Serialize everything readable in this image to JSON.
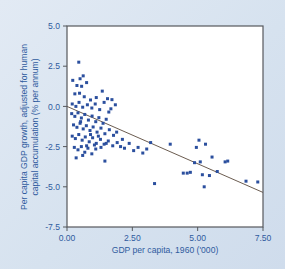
{
  "figure": {
    "background_color": "#dce6f0",
    "plot_area_color": "#ffffff",
    "frame_color": "#55585c",
    "text_color": "#2f5b9e",
    "marker_color": "#2b4f9e",
    "trendline_color": "#5a4a3c"
  },
  "chart_data": {
    "type": "scatter",
    "title": "",
    "subtitle": "",
    "xlabel": "GDP per capita, 1960 ('000)",
    "ylabel": "Per capita GDP growth, adjusted for human capital accumulation (% per annum)",
    "ylabel_line1": "Per capita GDP growth, adjusted for human",
    "ylabel_line2": "capital accumulation (% per annum)",
    "xlim": [
      0.0,
      7.5
    ],
    "ylim": [
      -7.5,
      5.0
    ],
    "xticks": [
      0.0,
      2.5,
      5.0,
      7.5
    ],
    "xtick_labels": [
      "0.00",
      "2.50",
      "5.00",
      "7.50"
    ],
    "yticks": [
      5.0,
      2.5,
      0.0,
      -2.5,
      -5.0,
      -7.5
    ],
    "ytick_labels": [
      "5.0",
      "2.5",
      "0.0",
      "-2.5",
      "-5.0",
      "-7.5"
    ],
    "grid": false,
    "legend": null,
    "legend_position": "none",
    "marker_shape": "square",
    "marker_size": 3,
    "trendline": {
      "label": "regression line",
      "x": [
        0.0,
        7.5
      ],
      "y": [
        0.0,
        -5.35
      ]
    },
    "points": [
      {
        "x": 0.45,
        "y": 2.75
      },
      {
        "x": 0.22,
        "y": 1.62
      },
      {
        "x": 0.5,
        "y": 1.72
      },
      {
        "x": 0.62,
        "y": 1.9
      },
      {
        "x": 0.38,
        "y": 1.3
      },
      {
        "x": 0.56,
        "y": 1.25
      },
      {
        "x": 0.75,
        "y": 1.48
      },
      {
        "x": 1.35,
        "y": 0.95
      },
      {
        "x": 0.3,
        "y": 0.78
      },
      {
        "x": 0.48,
        "y": 0.82
      },
      {
        "x": 0.66,
        "y": 0.6
      },
      {
        "x": 0.9,
        "y": 0.4
      },
      {
        "x": 1.12,
        "y": 0.55
      },
      {
        "x": 1.55,
        "y": 0.48
      },
      {
        "x": 1.72,
        "y": 0.42
      },
      {
        "x": 1.85,
        "y": 0.1
      },
      {
        "x": 0.2,
        "y": 0.15
      },
      {
        "x": 0.34,
        "y": 0.0
      },
      {
        "x": 0.46,
        "y": 0.25
      },
      {
        "x": 0.6,
        "y": -0.05
      },
      {
        "x": 0.78,
        "y": 0.1
      },
      {
        "x": 0.95,
        "y": -0.1
      },
      {
        "x": 1.08,
        "y": 0.15
      },
      {
        "x": 1.25,
        "y": -0.2
      },
      {
        "x": 1.42,
        "y": 0.25
      },
      {
        "x": 1.6,
        "y": -0.35
      },
      {
        "x": 0.18,
        "y": -0.45
      },
      {
        "x": 0.3,
        "y": -0.62
      },
      {
        "x": 0.42,
        "y": -0.4
      },
      {
        "x": 0.55,
        "y": -0.72
      },
      {
        "x": 0.68,
        "y": -0.5
      },
      {
        "x": 0.82,
        "y": -0.85
      },
      {
        "x": 0.96,
        "y": -0.6
      },
      {
        "x": 1.1,
        "y": -0.95
      },
      {
        "x": 1.22,
        "y": -0.7
      },
      {
        "x": 1.38,
        "y": -1.05
      },
      {
        "x": 1.5,
        "y": -0.8
      },
      {
        "x": 0.25,
        "y": -1.15
      },
      {
        "x": 0.38,
        "y": -1.3
      },
      {
        "x": 0.5,
        "y": -1.05
      },
      {
        "x": 0.62,
        "y": -1.4
      },
      {
        "x": 0.74,
        "y": -1.2
      },
      {
        "x": 0.88,
        "y": -1.5
      },
      {
        "x": 1.0,
        "y": -1.28
      },
      {
        "x": 1.15,
        "y": -1.6
      },
      {
        "x": 1.3,
        "y": -1.35
      },
      {
        "x": 1.45,
        "y": -1.7
      },
      {
        "x": 1.62,
        "y": -1.45
      },
      {
        "x": 1.78,
        "y": -1.8
      },
      {
        "x": 0.2,
        "y": -1.85
      },
      {
        "x": 0.32,
        "y": -2.0
      },
      {
        "x": 0.45,
        "y": -1.75
      },
      {
        "x": 0.58,
        "y": -2.1
      },
      {
        "x": 0.7,
        "y": -1.9
      },
      {
        "x": 0.85,
        "y": -2.2
      },
      {
        "x": 0.98,
        "y": -1.95
      },
      {
        "x": 1.12,
        "y": -2.3
      },
      {
        "x": 1.28,
        "y": -2.05
      },
      {
        "x": 1.42,
        "y": -2.35
      },
      {
        "x": 1.58,
        "y": -2.15
      },
      {
        "x": 1.75,
        "y": -2.45
      },
      {
        "x": 1.92,
        "y": -2.25
      },
      {
        "x": 0.28,
        "y": -2.55
      },
      {
        "x": 0.42,
        "y": -2.7
      },
      {
        "x": 0.55,
        "y": -2.5
      },
      {
        "x": 0.68,
        "y": -2.85
      },
      {
        "x": 0.8,
        "y": -2.6
      },
      {
        "x": 0.95,
        "y": -2.95
      },
      {
        "x": 1.1,
        "y": -2.65
      },
      {
        "x": 1.3,
        "y": -2.55
      },
      {
        "x": 1.5,
        "y": -2.3
      },
      {
        "x": 0.35,
        "y": -3.2
      },
      {
        "x": 0.6,
        "y": -3.05
      },
      {
        "x": 1.45,
        "y": -3.4
      },
      {
        "x": 2.05,
        "y": -2.5
      },
      {
        "x": 2.2,
        "y": -2.6
      },
      {
        "x": 2.38,
        "y": -2.3
      },
      {
        "x": 2.55,
        "y": -2.75
      },
      {
        "x": 2.72,
        "y": -2.55
      },
      {
        "x": 2.9,
        "y": -2.9
      },
      {
        "x": 3.05,
        "y": -2.65
      },
      {
        "x": 3.2,
        "y": -2.25
      },
      {
        "x": 3.35,
        "y": -4.8
      },
      {
        "x": 3.95,
        "y": -2.35
      },
      {
        "x": 4.45,
        "y": -4.15
      },
      {
        "x": 4.6,
        "y": -4.15
      },
      {
        "x": 4.72,
        "y": -4.1
      },
      {
        "x": 4.88,
        "y": -3.5
      },
      {
        "x": 4.95,
        "y": -2.55
      },
      {
        "x": 5.05,
        "y": -2.1
      },
      {
        "x": 5.1,
        "y": -3.45
      },
      {
        "x": 5.18,
        "y": -4.25
      },
      {
        "x": 5.25,
        "y": -5.0
      },
      {
        "x": 5.3,
        "y": -2.35
      },
      {
        "x": 5.45,
        "y": -4.3
      },
      {
        "x": 5.55,
        "y": -3.15
      },
      {
        "x": 5.75,
        "y": -4.05
      },
      {
        "x": 6.05,
        "y": -3.45
      },
      {
        "x": 6.15,
        "y": -3.4
      },
      {
        "x": 6.85,
        "y": -4.65
      },
      {
        "x": 7.3,
        "y": -4.7
      },
      {
        "x": 1.68,
        "y": -0.15
      },
      {
        "x": 1.9,
        "y": -1.6
      },
      {
        "x": 2.12,
        "y": -2.05
      },
      {
        "x": 0.52,
        "y": -0.95
      },
      {
        "x": 0.9,
        "y": -1.75
      },
      {
        "x": 1.2,
        "y": -1.85
      },
      {
        "x": 0.75,
        "y": -2.45
      },
      {
        "x": 1.05,
        "y": -2.4
      }
    ]
  }
}
